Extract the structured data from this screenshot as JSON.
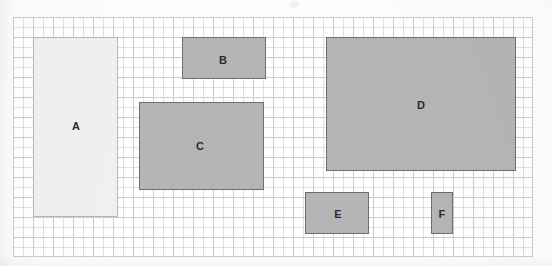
{
  "figure": {
    "type": "grid-rectangles-area-diagram",
    "background_color": "#ffffff",
    "grid": {
      "name": "square-grid",
      "cell_size_px": 20,
      "columns": 26,
      "rows": 12,
      "origin_x_px": 13,
      "origin_y_px": 17,
      "width_px": 520,
      "height_px": 240,
      "line_color": "#c9ccd2",
      "minor_line_color": "#b9bec6"
    },
    "rectangles": [
      {
        "label": "A",
        "x_px": 33,
        "y_px": 37,
        "width_px": 85,
        "height_px": 180,
        "grid_width_cells": 4,
        "grid_height_cells": 9,
        "area_cells": 36,
        "fill_color": "#f0f0f0",
        "border_color": "#b8b8b8",
        "border_px": 1,
        "label_x_px": 75,
        "label_y_px": 125
      },
      {
        "label": "B",
        "x_px": 182,
        "y_px": 37,
        "width_px": 84,
        "height_px": 42,
        "grid_width_cells": 4,
        "grid_height_cells": 2,
        "area_cells": 8,
        "fill_color": "#b5b5b5",
        "border_color": "#6e6e6e",
        "border_px": 1,
        "label_x_px": 222,
        "label_y_px": 59
      },
      {
        "label": "C",
        "x_px": 139,
        "y_px": 102,
        "width_px": 125,
        "height_px": 88,
        "grid_width_cells": 6,
        "grid_height_cells": 4,
        "area_cells": 24,
        "fill_color": "#b5b5b5",
        "border_color": "#6e6e6e",
        "border_px": 1,
        "label_x_px": 199,
        "label_y_px": 145
      },
      {
        "label": "D",
        "x_px": 326,
        "y_px": 37,
        "width_px": 190,
        "height_px": 134,
        "grid_width_cells": 9,
        "grid_height_cells": 7,
        "area_cells": 63,
        "fill_color": "#b5b5b5",
        "border_color": "#6e6e6e",
        "border_px": 1,
        "label_x_px": 420,
        "label_y_px": 104
      },
      {
        "label": "E",
        "x_px": 305,
        "y_px": 192,
        "width_px": 64,
        "height_px": 42,
        "grid_width_cells": 3,
        "grid_height_cells": 2,
        "area_cells": 6,
        "fill_color": "#b5b5b5",
        "border_color": "#6e6e6e",
        "border_px": 1,
        "label_x_px": 337,
        "label_y_px": 213
      },
      {
        "label": "F",
        "x_px": 431,
        "y_px": 192,
        "width_px": 22,
        "height_px": 42,
        "grid_width_cells": 1,
        "grid_height_cells": 2,
        "area_cells": 2,
        "fill_color": "#b5b5b5",
        "border_color": "#6e6e6e",
        "border_px": 1,
        "label_x_px": 441,
        "label_y_px": 213
      }
    ]
  }
}
